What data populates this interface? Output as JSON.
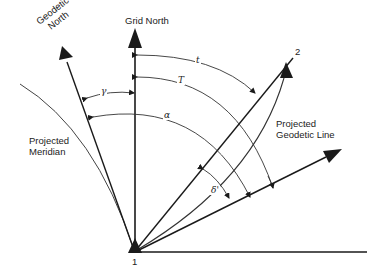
{
  "labels": {
    "geodetic_north_line1": "Geodetic",
    "geodetic_north_line2": "North",
    "grid_north": "Grid North",
    "projected_meridian_line1": "Projected",
    "projected_meridian_line2": "Meridian",
    "projected_geodetic_line1": "Projected",
    "projected_geodetic_line2": "Geodetic Line",
    "point_1": "1",
    "point_2": "2"
  },
  "angles": {
    "gamma": "γ",
    "t": "t",
    "T": "T",
    "alpha": "α",
    "delta": "δ'"
  },
  "colors": {
    "line": "#1a1a1a",
    "thin_line": "#444444",
    "background": "#ffffff"
  }
}
